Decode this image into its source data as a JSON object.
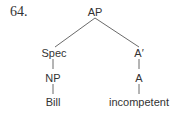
{
  "example_number": "64.",
  "tree": {
    "root": "AP",
    "left": {
      "label": "Spec",
      "child": "NP",
      "leaf": "Bill"
    },
    "right": {
      "label": "A′",
      "child": "A",
      "leaf": "incompetent"
    }
  }
}
